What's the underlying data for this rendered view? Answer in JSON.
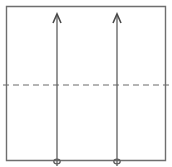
{
  "figure": {
    "canvas": {
      "width": 172,
      "height": 167,
      "background": "#ffffff"
    },
    "colors": {
      "box_stroke": "#6e6e6e",
      "dashed_line_stroke": "#6a6a6a",
      "arrow_stroke": "#5f5f5f",
      "arrowhead_fill": "#4a4a4a",
      "background": "#ffffff"
    },
    "box": {
      "label": "outer rectangle",
      "x": 6.5,
      "y": 6.5,
      "width": 159,
      "height": 154,
      "stroke_width": 1.4,
      "fill": "none"
    },
    "dashed_line": {
      "label": "horizontal dashed midline",
      "x1": 3,
      "x2": 169,
      "y": 85,
      "stroke_width": 1.2,
      "dash_length": 6,
      "gap_length": 4
    },
    "arrows": [
      {
        "id": "arrow-left",
        "label": "left upward arrow",
        "x": 57,
        "y_tail": 166,
        "y_tip": 14,
        "stroke_width": 1.3,
        "head_width": 8,
        "head_height": 9,
        "direction": "up",
        "tail_loop": {
          "cx": 57,
          "cy": 161.5,
          "rx": 3.2,
          "ry": 2.4
        }
      },
      {
        "id": "arrow-right",
        "label": "right upward arrow",
        "x": 117,
        "y_tail": 166,
        "y_tip": 14,
        "stroke_width": 1.3,
        "head_width": 8,
        "head_height": 9,
        "direction": "up",
        "tail_loop": {
          "cx": 117,
          "cy": 161.5,
          "rx": 3.2,
          "ry": 2.4
        }
      }
    ]
  }
}
